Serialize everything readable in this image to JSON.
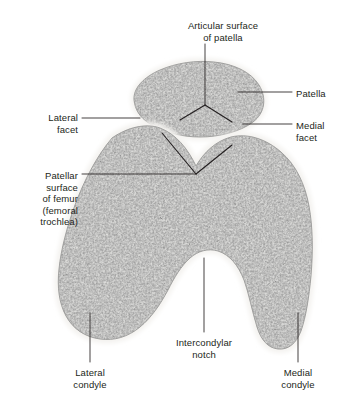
{
  "figure": {
    "title": "Articular surface of patella",
    "background_color": "#ffffff",
    "ink_color": "#231f20",
    "bone_fill_color": "#d8d8d6",
    "bone_speckle_color": "#4a4a4a",
    "cartilage_color": "#f2f1ee",
    "outline_color": "#8c8c8c"
  },
  "labels": [
    {
      "id": "articular-surface-of-patella",
      "text": "Articular surface\nof patella",
      "align": "center",
      "x": 168,
      "y": 20,
      "width": 110
    },
    {
      "id": "patella",
      "text": "Patella",
      "align": "left",
      "x": 296,
      "y": 88,
      "width": 48
    },
    {
      "id": "medial-facet",
      "text": "Medial\nfacet",
      "align": "left",
      "x": 296,
      "y": 120,
      "width": 48
    },
    {
      "id": "lateral-facet",
      "text": "Lateral\nfacet",
      "align": "right",
      "x": 18,
      "y": 112,
      "width": 60
    },
    {
      "id": "patellar-surface-of-femur",
      "text": "Patellar\nsurface\nof femur\n(femoral\ntrochlea)",
      "align": "right",
      "x": 8,
      "y": 170,
      "width": 70
    },
    {
      "id": "lateral-condyle",
      "text": "Lateral\ncondyle",
      "align": "center",
      "x": 54,
      "y": 367,
      "width": 72
    },
    {
      "id": "intercondylar-notch",
      "text": "Intercondylar\nnotch",
      "align": "center",
      "x": 155,
      "y": 337,
      "width": 98
    },
    {
      "id": "medial-condyle",
      "text": "Medial\ncondyle",
      "align": "center",
      "x": 262,
      "y": 367,
      "width": 72
    }
  ],
  "leader_lines": [
    {
      "id": "leader-articular-surface-of-patella",
      "points": "205,44 205,105"
    },
    {
      "id": "leader-patella",
      "points": "292,92 238,92"
    },
    {
      "id": "leader-medial-facet",
      "points": "292,124 243,124"
    },
    {
      "id": "leader-lateral-facet",
      "points": "82,118 140,118"
    },
    {
      "id": "leader-patellar-surface-of-femur",
      "points": "82,174 196,174"
    },
    {
      "id": "leader-lateral-condyle",
      "points": "90,362 90,313"
    },
    {
      "id": "leader-intercondylar-notch",
      "points": "204,332 204,258"
    },
    {
      "id": "leader-medial-condyle",
      "points": "298,362 298,313"
    }
  ],
  "facet_marks": [
    {
      "id": "patella-ridge-vertex",
      "points": "205,105 180,120"
    },
    {
      "id": "patella-ridge-medial",
      "points": "205,105 232,122"
    },
    {
      "id": "femur-groove-lateral",
      "points": "196,174 162,133"
    },
    {
      "id": "femur-groove-medial",
      "points": "196,174 232,145"
    }
  ],
  "structures": [
    {
      "id": "patella-bone",
      "name": "Patella (transverse section)"
    },
    {
      "id": "femur-bone",
      "name": "Distal femur (transverse section)"
    },
    {
      "id": "lateral-condyle-region",
      "name": "Lateral condyle"
    },
    {
      "id": "medial-condyle-region",
      "name": "Medial condyle"
    },
    {
      "id": "intercondylar-notch-region",
      "name": "Intercondylar notch"
    },
    {
      "id": "trochlear-groove-region",
      "name": "Patellar surface of femur (femoral trochlea)"
    }
  ]
}
